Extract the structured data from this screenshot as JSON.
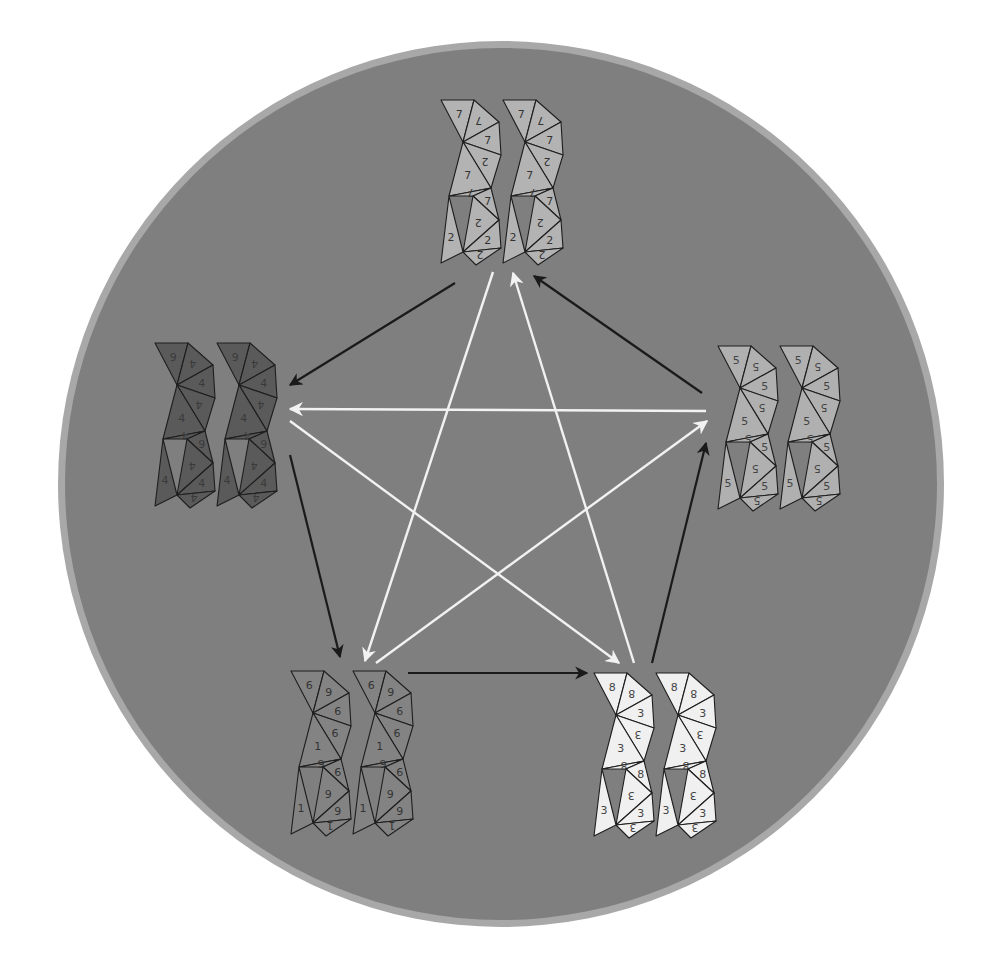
{
  "diagram": {
    "title": "",
    "background": {
      "disk_color": "#7f7f7f",
      "ring_color": "#a8a8a8",
      "page_color": "#ffffff"
    },
    "disk": {
      "cx": 501,
      "cy": 484,
      "r": 443,
      "ring_width": 7
    },
    "nodes": [
      {
        "id": "n7",
        "label": "7",
        "secondary_label": "2",
        "position": "top",
        "x": 441,
        "y": 100,
        "fill": "#b3b3b3",
        "text_color": "#333333",
        "strip_labels": [
          "7",
          "7",
          "7",
          "2",
          "7",
          "7",
          "7",
          "2",
          "2",
          "2"
        ]
      },
      {
        "id": "n4",
        "label": "4",
        "secondary_label": "9",
        "position": "left",
        "x": 155,
        "y": 343,
        "fill": "#5a5a5a",
        "text_color": "#3a3a3a",
        "strip_labels": [
          "9",
          "4",
          "4",
          "4",
          "4",
          "4",
          "9",
          "4",
          "4",
          "4"
        ]
      },
      {
        "id": "n5",
        "label": "5",
        "secondary_label": "5",
        "position": "right",
        "x": 718,
        "y": 346,
        "fill": "#b0b0b0",
        "text_color": "#444444",
        "strip_labels": [
          "5",
          "5",
          "5",
          "5",
          "5",
          "5",
          "5",
          "5",
          "5",
          "5"
        ]
      },
      {
        "id": "n6",
        "label": "6",
        "secondary_label": "1",
        "position": "bottom-left",
        "x": 291,
        "y": 671,
        "fill": "#838383",
        "text_color": "#333333",
        "strip_labels": [
          "6",
          "6",
          "6",
          "9",
          "1",
          "6",
          "6",
          "6",
          "9",
          "1"
        ]
      },
      {
        "id": "n8",
        "label": "8",
        "secondary_label": "3",
        "position": "bottom-right",
        "x": 594,
        "y": 673,
        "fill": "#f0f0f0",
        "text_color": "#444444",
        "strip_labels": [
          "8",
          "8",
          "3",
          "3",
          "3",
          "8",
          "8",
          "3",
          "3",
          "3"
        ]
      }
    ],
    "edges": [
      {
        "from": "n7",
        "to": "n4",
        "color": "#1a1a1a",
        "kind": "outer-cycle",
        "x1": 455,
        "y1": 283,
        "x2": 290,
        "y2": 385
      },
      {
        "from": "n4",
        "to": "n6",
        "color": "#1a1a1a",
        "kind": "outer-cycle",
        "x1": 290,
        "y1": 455,
        "x2": 340,
        "y2": 657
      },
      {
        "from": "n6",
        "to": "n8",
        "color": "#1a1a1a",
        "kind": "outer-cycle",
        "x1": 408,
        "y1": 673,
        "x2": 587,
        "y2": 673
      },
      {
        "from": "n8",
        "to": "n5",
        "color": "#1a1a1a",
        "kind": "outer-cycle",
        "x1": 652,
        "y1": 663,
        "x2": 706,
        "y2": 443
      },
      {
        "from": "n5",
        "to": "n7",
        "color": "#1a1a1a",
        "kind": "outer-cycle",
        "x1": 702,
        "y1": 393,
        "x2": 534,
        "y2": 276
      },
      {
        "from": "n5",
        "to": "n4",
        "color": "#f2f2f2",
        "kind": "star",
        "x1": 706,
        "y1": 411,
        "x2": 290,
        "y2": 409
      },
      {
        "from": "n4",
        "to": "n8",
        "color": "#f2f2f2",
        "kind": "star",
        "x1": 290,
        "y1": 421,
        "x2": 619,
        "y2": 663
      },
      {
        "from": "n7",
        "to": "n6",
        "color": "#f2f2f2",
        "kind": "star",
        "x1": 493,
        "y1": 272,
        "x2": 365,
        "y2": 661
      },
      {
        "from": "n8",
        "to": "n7",
        "color": "#f2f2f2",
        "kind": "star",
        "x1": 634,
        "y1": 663,
        "x2": 513,
        "y2": 273
      },
      {
        "from": "n6",
        "to": "n5",
        "color": "#f2f2f2",
        "kind": "star",
        "x1": 376,
        "y1": 663,
        "x2": 707,
        "y2": 421
      }
    ]
  }
}
